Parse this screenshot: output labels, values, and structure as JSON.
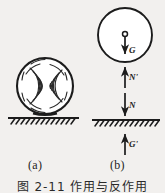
{
  "figure": {
    "title": "图 2-11  作用与反作用",
    "panels": [
      {
        "id": "a",
        "caption": "(a)",
        "description": "deformed-ball-on-ground"
      },
      {
        "id": "b",
        "caption": "(b)",
        "description": "free-body-force-diagram"
      }
    ],
    "force_labels": {
      "weight": "G",
      "normal_reaction": "N'",
      "normal_force": "N",
      "earth_reaction": "G'"
    },
    "colors": {
      "ink": "#1c1c1c",
      "paper": "#f2f0ee"
    }
  }
}
